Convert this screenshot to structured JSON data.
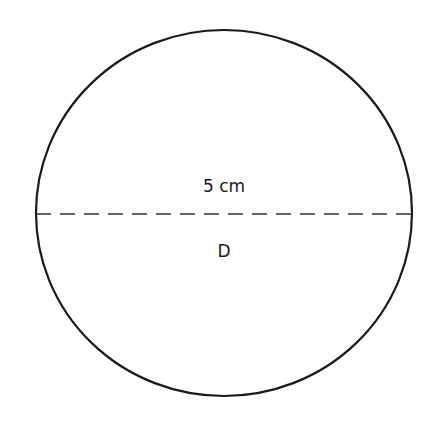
{
  "diagram": {
    "shape": "circle",
    "measurement_label": "5 cm",
    "line_label": "D",
    "line_style": "dashed",
    "stroke_color": "#1a1a1a",
    "background": "#ffffff"
  }
}
